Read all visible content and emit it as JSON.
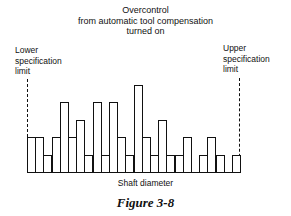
{
  "title": [
    "Overcontrol",
    "from automatic tool compensation",
    "turned on"
  ],
  "lower_limit_label": [
    "Lower",
    "specification",
    "limit"
  ],
  "upper_limit_label": [
    "Upper",
    "specification",
    "limit"
  ],
  "xlabel": "Shaft diameter",
  "caption": "Figure 3-8",
  "chart_data": {
    "type": "bar",
    "title": "Overcontrol from automatic tool compensation turned on",
    "xlabel": "Shaft diameter",
    "ylabel": "",
    "values": [
      2,
      2,
      1,
      2,
      4,
      2,
      3,
      1,
      4,
      1,
      4,
      2,
      1,
      5,
      2,
      1,
      3,
      1,
      1,
      2,
      0,
      1,
      2,
      1,
      0,
      1
    ],
    "annotations": [
      "Lower specification limit",
      "Upper specification limit"
    ],
    "grid": false
  }
}
